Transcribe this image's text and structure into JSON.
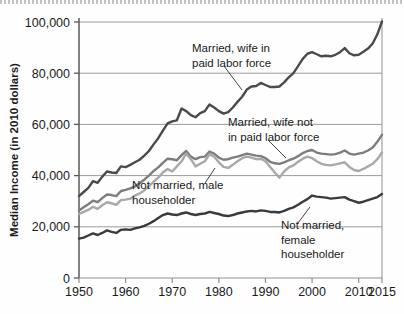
{
  "chart_data": {
    "type": "line",
    "title": "",
    "subtitle": "",
    "xlabel": "",
    "ylabel": "Median Income (in 2010 dollars)",
    "xlim": [
      1950,
      2015
    ],
    "ylim": [
      0,
      100000
    ],
    "grid": true,
    "grid_axis": "y",
    "legend_position": "inline-annotations",
    "y_ticks": [
      0,
      20000,
      40000,
      60000,
      80000,
      100000
    ],
    "y_tick_labels": [
      "0",
      "20,000",
      "40,000",
      "60,000",
      "80,000",
      "100,000"
    ],
    "x_ticks": [
      1950,
      1960,
      1970,
      1980,
      1990,
      2000,
      2010,
      2015
    ],
    "x_tick_labels": [
      "1950",
      "1960",
      "1970",
      "1980",
      "1990",
      "2000",
      "2010",
      "2015"
    ],
    "x": [
      1950,
      1951,
      1952,
      1953,
      1954,
      1955,
      1956,
      1957,
      1958,
      1959,
      1960,
      1961,
      1962,
      1963,
      1964,
      1965,
      1966,
      1967,
      1968,
      1969,
      1970,
      1971,
      1972,
      1973,
      1974,
      1975,
      1976,
      1977,
      1978,
      1979,
      1980,
      1981,
      1982,
      1983,
      1984,
      1985,
      1986,
      1987,
      1988,
      1989,
      1990,
      1991,
      1992,
      1993,
      1994,
      1995,
      1996,
      1997,
      1998,
      1999,
      2000,
      2001,
      2002,
      2003,
      2004,
      2005,
      2006,
      2007,
      2008,
      2009,
      2010,
      2011,
      2012,
      2013,
      2014,
      2015
    ],
    "series": [
      {
        "name": "Married, wife in paid labor force",
        "color": "#4a4a4a",
        "width": 2.4,
        "values": [
          32000,
          33600,
          35200,
          37800,
          37200,
          39600,
          41600,
          41200,
          41000,
          43600,
          43300,
          44200,
          45200,
          46200,
          47800,
          49600,
          52200,
          54600,
          57600,
          60400,
          61200,
          61600,
          66200,
          65200,
          63600,
          62800,
          64400,
          65200,
          67800,
          66600,
          65200,
          64200,
          64800,
          66600,
          68800,
          70800,
          73600,
          74800,
          75000,
          76200,
          75400,
          74600,
          74600,
          74800,
          76400,
          78400,
          80000,
          82800,
          85600,
          87600,
          88200,
          87400,
          86600,
          86800,
          86600,
          87200,
          88200,
          89800,
          87800,
          87000,
          87200,
          88400,
          89600,
          91600,
          95200,
          100200
        ]
      },
      {
        "name": "Married, wife not in paid labor force",
        "color": "#7d7d7d",
        "width": 2.4,
        "values": [
          26400,
          27600,
          28800,
          30200,
          29600,
          31200,
          32600,
          32400,
          32000,
          34000,
          34400,
          35000,
          35800,
          37000,
          38400,
          40000,
          41800,
          43200,
          45000,
          46600,
          46400,
          46000,
          48000,
          49600,
          47400,
          46400,
          47200,
          47400,
          49400,
          48600,
          47000,
          46200,
          46400,
          47000,
          47400,
          48000,
          48600,
          48200,
          47800,
          47600,
          46800,
          45400,
          44800,
          44600,
          45200,
          46000,
          46600,
          47600,
          48800,
          49600,
          50000,
          49000,
          48600,
          48400,
          48200,
          48400,
          49000,
          49800,
          48600,
          48200,
          48600,
          49000,
          49800,
          51000,
          53200,
          56000
        ]
      },
      {
        "name": "Not married, male householder",
        "color": "#a8a8a8",
        "width": 2.4,
        "values": [
          25000,
          25800,
          26600,
          27800,
          27000,
          28400,
          29600,
          29200,
          28600,
          30400,
          30600,
          31000,
          32200,
          33000,
          34200,
          35800,
          37600,
          39200,
          41200,
          42600,
          41600,
          43600,
          45600,
          48600,
          46400,
          43600,
          44600,
          45600,
          48400,
          47400,
          45200,
          43400,
          43000,
          44200,
          45600,
          46800,
          47400,
          47000,
          46400,
          46600,
          45600,
          43400,
          41200,
          39200,
          41600,
          43200,
          44000,
          45400,
          46600,
          47400,
          46800,
          45600,
          44600,
          44200,
          44000,
          44400,
          44800,
          45200,
          43400,
          42200,
          41800,
          42600,
          43600,
          44600,
          46400,
          49000
        ]
      },
      {
        "name": "Not married, female householder",
        "color": "#3a3a3a",
        "width": 2.4,
        "values": [
          15400,
          15800,
          16600,
          17400,
          16800,
          17600,
          18600,
          18000,
          17600,
          18800,
          19000,
          18800,
          19400,
          19800,
          20400,
          21200,
          22200,
          23400,
          24600,
          25200,
          24800,
          24600,
          25200,
          25600,
          25000,
          24600,
          25000,
          25200,
          25800,
          25400,
          25000,
          24400,
          24200,
          24600,
          25200,
          25600,
          26000,
          26200,
          26000,
          26400,
          26200,
          25800,
          25800,
          25600,
          26200,
          27000,
          27600,
          28600,
          29800,
          30800,
          32200,
          31800,
          31600,
          31400,
          31000,
          31200,
          31400,
          31600,
          30600,
          30000,
          29400,
          29800,
          30400,
          31000,
          31600,
          32800
        ]
      }
    ],
    "annotations": [
      {
        "id": "ann-married-wife-in-labor",
        "lines": [
          "Married, wife in",
          "paid labor force"
        ],
        "text": "Married, wife in paid labor force",
        "series": "Married, wife in paid labor force"
      },
      {
        "id": "ann-married-wife-not-in-labor",
        "lines": [
          "Married, wife not",
          "in paid labor force"
        ],
        "text": "Married, wife not in paid labor force",
        "series": "Married, wife not in paid labor force"
      },
      {
        "id": "ann-not-married-male",
        "lines": [
          "Not married, male",
          "householder"
        ],
        "text": "Not married, male householder",
        "series": "Not married, male householder"
      },
      {
        "id": "ann-not-married-female",
        "lines": [
          "Not married,",
          "female",
          "householder"
        ],
        "text": "Not married, female householder",
        "series": "Not married, female householder"
      }
    ]
  }
}
